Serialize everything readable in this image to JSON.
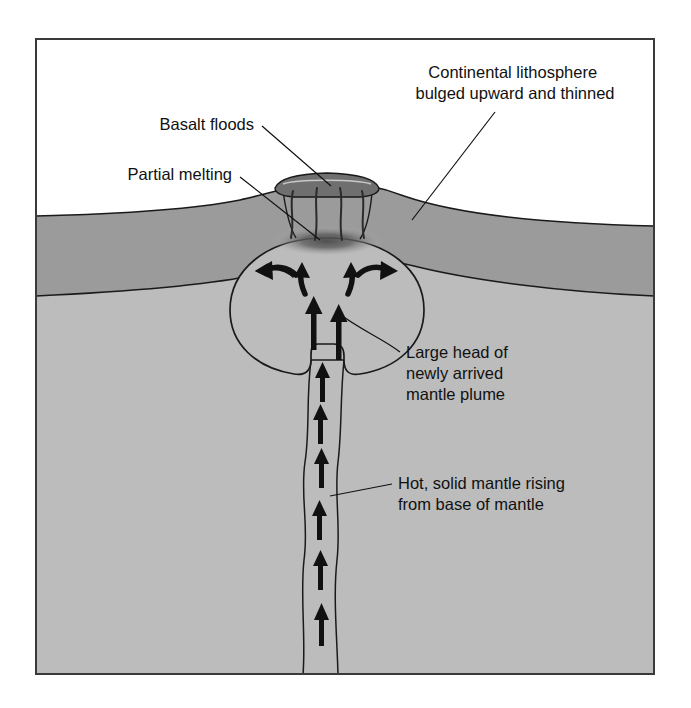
{
  "figure": {
    "frame": {
      "x": 35,
      "y": 38,
      "width": 620,
      "height": 637,
      "border_color": "#3a3a3a"
    }
  },
  "palette": {
    "background": "#ffffff",
    "sky": "#ffffff",
    "lithosphere": "#9b9b9b",
    "mantle": "#bcbcbc",
    "plume_head": "#b9b9b9",
    "basalt_cap": "#6f6f6f",
    "partial_melt": "#6a6a6a",
    "outline": "#1a1a1a",
    "text": "#111111"
  },
  "labels": [
    {
      "id": "continental-lithosphere",
      "lines": [
        "Continental lithosphere",
        "bulged upward and thinned"
      ],
      "x": 515,
      "y": 78,
      "anchor": "middle",
      "leader": "M 495 112 L 412 220"
    },
    {
      "id": "basalt-floods",
      "lines": [
        "Basalt floods"
      ],
      "x": 254,
      "y": 130,
      "anchor": "end",
      "leader": "M 262 126 L 330 186"
    },
    {
      "id": "partial-melting",
      "lines": [
        "Partial melting"
      ],
      "x": 232,
      "y": 180,
      "anchor": "end",
      "leader": "M 240 177 L 316 238"
    },
    {
      "id": "large-head-of-newly-arrived-mantle-plume",
      "lines": [
        "Large head of",
        "newly arrived",
        "mantle plume"
      ],
      "x": 406,
      "y": 358,
      "anchor": "start",
      "leader": "M 400 352 L 337 314"
    },
    {
      "id": "hot-solid-mantle-rising-from-base-of-mantle",
      "lines": [
        "Hot, solid mantle rising",
        "from base of mantle"
      ],
      "x": 398,
      "y": 489,
      "anchor": "start",
      "leader": "M 392 484 L 330 496"
    }
  ],
  "features": {
    "basalt_cap_label": "basalt flood cap",
    "feeder_dikes_count": 4,
    "plume_head_label": "plume head",
    "conduit_label": "plume conduit",
    "conduit_arrow_count": 7,
    "head_arrow_count": 6,
    "partial_melt_label": "partial melt lens"
  }
}
